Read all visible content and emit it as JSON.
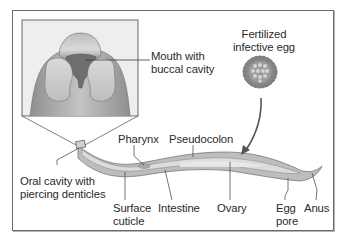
{
  "diagram": {
    "type": "labeled anatomical illustration",
    "colors": {
      "frame_border": "#6a6a6a",
      "inset_bg": "#eeeeee",
      "worm_outer": "#b9b9b9",
      "worm_inner": "#d6d6d6",
      "head_dark": "#6e6e6e",
      "line": "#4a4a4a",
      "text": "#2b2b2b"
    },
    "labels": {
      "mouth": "Mouth with\nbuccal cavity",
      "egg": "Fertilized\ninfective egg",
      "oral_cavity": "Oral cavity with\npiercing denticles",
      "pharynx": "Pharynx",
      "pseudocolon": "Pseudocolon",
      "surface_cuticle": "Surface\ncuticle",
      "intestine": "Intestine",
      "ovary": "Ovary",
      "egg_pore": "Egg\npore",
      "anus": "Anus"
    }
  }
}
